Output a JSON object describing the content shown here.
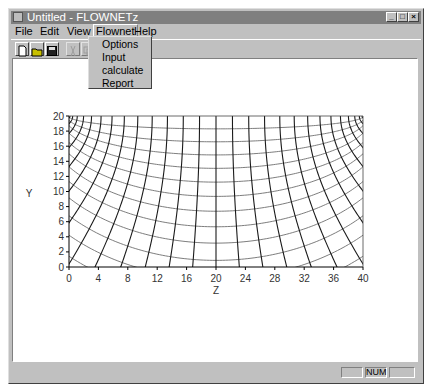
{
  "window": {
    "title": "Untitled - FLOWNETz",
    "controls": {
      "minimize": "_",
      "maximize": "□",
      "close": "×"
    }
  },
  "menubar": {
    "items": [
      {
        "label": "File",
        "accel": "F"
      },
      {
        "label": "Edit",
        "accel": "E"
      },
      {
        "label": "View",
        "accel": "V"
      },
      {
        "label": "Flownet",
        "accel": ""
      },
      {
        "label": "Help",
        "accel": "H"
      }
    ],
    "open_menu": "Flownet",
    "dropdown": [
      "Options",
      "Input",
      "calculate",
      "Report"
    ]
  },
  "toolbar": {
    "buttons": [
      {
        "name": "new-file-icon",
        "enabled": true
      },
      {
        "name": "open-folder-icon",
        "enabled": true
      },
      {
        "name": "save-disk-icon",
        "enabled": true
      },
      {
        "name": "cut-icon",
        "enabled": false
      },
      {
        "name": "copy-icon",
        "enabled": false
      }
    ]
  },
  "chart_data": {
    "type": "line",
    "title": "",
    "xlabel": "Z",
    "ylabel": "Y",
    "xlim": [
      0,
      40
    ],
    "ylim": [
      0,
      20
    ],
    "xticks": [
      0,
      4,
      8,
      12,
      16,
      20,
      24,
      28,
      32,
      36,
      40
    ],
    "yticks": [
      0,
      2,
      4,
      6,
      8,
      10,
      12,
      14,
      16,
      18,
      20
    ],
    "grid": false,
    "foci": [
      [
        0,
        20
      ],
      [
        40,
        20
      ]
    ],
    "flow_lines_count": 27,
    "equipotential_lines_count": 17,
    "left_axis_flowline_intercepts": [
      4.4,
      8.2,
      10.6,
      12.6,
      14.0,
      15.2,
      16.2,
      17.0,
      17.8,
      18.4,
      19.0
    ],
    "bottom_axis_flowline_intercepts": [
      5.6,
      9.5,
      12.2,
      14.8,
      17.0,
      19.0,
      21.0,
      23.2,
      25.6,
      28.0,
      30.6,
      34.6
    ],
    "colors": {
      "flow_lines": "#1a1a1a",
      "equipotentials": "#6e6e6e",
      "axes": "#000000"
    }
  },
  "statusbar": {
    "panes": [
      "",
      "NUM",
      ""
    ]
  }
}
